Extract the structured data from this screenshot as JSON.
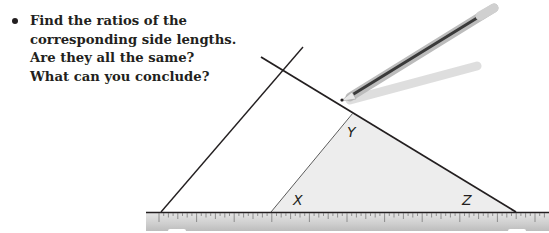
{
  "prompt": {
    "bullet": "•",
    "lines": [
      "Find the ratios of the",
      "corresponding side lengths.",
      "Are they all the same?",
      "What can you conclude?"
    ]
  },
  "figure": {
    "vertex_labels": {
      "x": "X",
      "y": "Y",
      "z": "Z"
    },
    "colors": {
      "line": "#231f20",
      "triangle_fill": "#eeeeee",
      "ruler": "#d8d8d8"
    }
  }
}
